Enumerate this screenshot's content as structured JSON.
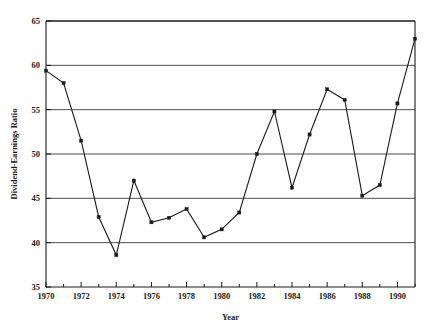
{
  "chart_data": {
    "type": "line",
    "title": "",
    "subtitle": "",
    "xlabel": "Year",
    "ylabel": "Dividend-Earnings Ratio",
    "xlim": [
      1970,
      1991
    ],
    "ylim": [
      35,
      65
    ],
    "grid": true,
    "grid_axis": "y",
    "legend": false,
    "legend_position": "none",
    "marker": "square",
    "line_color": "#1a1a1a",
    "x_tick_labels": [
      "1970",
      "1972",
      "1974",
      "1976",
      "1978",
      "1980",
      "1982",
      "1984",
      "1986",
      "1988",
      "1990"
    ],
    "x_tick_values": [
      1970,
      1972,
      1974,
      1976,
      1978,
      1980,
      1982,
      1984,
      1986,
      1988,
      1990
    ],
    "x_minor_tick_values": [
      1971,
      1973,
      1975,
      1977,
      1979,
      1981,
      1983,
      1985,
      1987,
      1989,
      1991
    ],
    "y_tick_labels": [
      "35",
      "40",
      "45",
      "50",
      "55",
      "60",
      "65"
    ],
    "y_tick_values": [
      35,
      40,
      45,
      50,
      55,
      60,
      65
    ],
    "x": [
      1970,
      1971,
      1972,
      1973,
      1974,
      1975,
      1976,
      1977,
      1978,
      1979,
      1980,
      1981,
      1982,
      1983,
      1984,
      1985,
      1986,
      1987,
      1988,
      1989,
      1990,
      1991
    ],
    "values": [
      59.4,
      58.0,
      51.5,
      42.9,
      38.6,
      47.0,
      42.3,
      42.8,
      43.8,
      40.6,
      41.5,
      43.4,
      50.0,
      54.8,
      46.2,
      52.2,
      57.3,
      56.1,
      45.3,
      46.5,
      55.7,
      63.0
    ],
    "series": [
      {
        "name": "Dividend-Earnings Ratio",
        "values": [
          59.4,
          58.0,
          51.5,
          42.9,
          38.6,
          47.0,
          42.3,
          42.8,
          43.8,
          40.6,
          41.5,
          43.4,
          50.0,
          54.8,
          46.2,
          52.2,
          57.3,
          56.1,
          45.3,
          46.5,
          55.7,
          63.0
        ]
      }
    ]
  }
}
